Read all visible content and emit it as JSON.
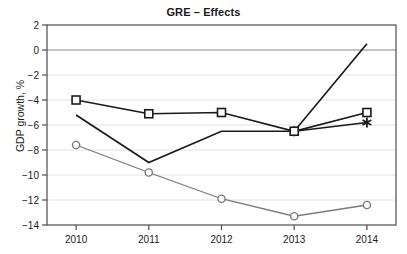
{
  "chart_data": {
    "type": "line",
    "title": "GRE – Effects",
    "xlabel": "",
    "ylabel": "GDP growth, %",
    "categories": [
      "2010",
      "2011",
      "2012",
      "2013",
      "2014"
    ],
    "x": [
      2010,
      2011,
      2012,
      2013,
      2014
    ],
    "xlim": [
      2009.6,
      2014.4
    ],
    "ylim": [
      -14,
      2
    ],
    "yticks": [
      2,
      0,
      -2,
      -4,
      -6,
      -8,
      -10,
      -12,
      -14
    ],
    "ytick_labels": [
      "2",
      "0",
      "−2",
      "−4",
      "−6",
      "−8",
      "−10",
      "−12",
      "−14"
    ],
    "xticks": [
      2010,
      2011,
      2012,
      2013,
      2014
    ],
    "xtick_labels": [
      "2010",
      "2011",
      "2012",
      "2013",
      "2014"
    ],
    "grid": true,
    "grid_axis": "y",
    "legend": "none",
    "zero_line": 0,
    "series": [
      {
        "name": "square-series",
        "marker": "square",
        "color": "#1a1a1a",
        "values": [
          -4.0,
          -5.1,
          -5.0,
          -6.5,
          -5.0
        ]
      },
      {
        "name": "plain-line-series",
        "marker": "none",
        "color": "#1a1a1a",
        "values": [
          -5.2,
          -9.0,
          -6.5,
          -6.5,
          0.5
        ]
      },
      {
        "name": "asterisk-series",
        "marker": "asterisk",
        "color": "#1a1a1a",
        "values": [
          null,
          null,
          null,
          -6.5,
          -5.8
        ]
      },
      {
        "name": "circle-series",
        "marker": "circle",
        "color": "#7a7a7a",
        "values": [
          -7.6,
          -9.8,
          -11.9,
          -13.3,
          -12.4
        ]
      }
    ],
    "colors": {
      "axis": "#4d4d4d",
      "grid": "#e2e2e2",
      "zero_line": "#b0b0b0",
      "frame": "#4d4d4d",
      "background": "#ffffff",
      "text": "#1a1a1a"
    }
  }
}
